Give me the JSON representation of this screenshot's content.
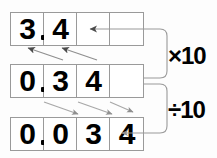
{
  "diagram": {
    "rows": [
      {
        "id": "row-1",
        "value": "3.4",
        "cells": [
          {
            "digit": "3",
            "empty": false
          },
          {
            "digit": "4",
            "empty": false
          },
          {
            "digit": "",
            "empty": true
          },
          {
            "digit": "",
            "empty": true
          }
        ],
        "decimal_after_cell": 0
      },
      {
        "id": "row-2",
        "value": "0.34",
        "cells": [
          {
            "digit": "0",
            "empty": false
          },
          {
            "digit": "3",
            "empty": false
          },
          {
            "digit": "4",
            "empty": false
          },
          {
            "digit": "",
            "empty": true
          }
        ],
        "decimal_after_cell": 0
      },
      {
        "id": "row-3",
        "value": "0.034",
        "cells": [
          {
            "digit": "0",
            "empty": false
          },
          {
            "digit": "0",
            "empty": false
          },
          {
            "digit": "3",
            "empty": false
          },
          {
            "digit": "4",
            "empty": false
          }
        ],
        "decimal_after_cell": 0
      }
    ],
    "operations": [
      {
        "id": "multiply",
        "label": "×10",
        "direction": "up",
        "from_row": "row-2",
        "to_row": "row-1"
      },
      {
        "id": "divide",
        "label": "÷10",
        "direction": "down",
        "from_row": "row-2",
        "to_row": "row-3"
      }
    ],
    "colors": {
      "grid_border": "#9a9a9a",
      "digit": "#000000",
      "arrow": "#8f8f8f",
      "bracket": "#9a9a9a",
      "background": "#fdfdfd"
    },
    "shift_arrows_up": 2,
    "shift_arrows_down": 3
  }
}
